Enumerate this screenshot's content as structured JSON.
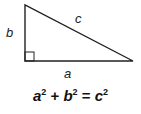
{
  "diagram": {
    "type": "right-triangle",
    "labels": {
      "a": "a",
      "b": "b",
      "c": "c"
    },
    "stroke_color": "#222222",
    "vertices": [
      [
        25,
        5
      ],
      [
        25,
        61
      ],
      [
        133,
        61
      ]
    ],
    "right_angle_marker": true
  },
  "formula": {
    "t1": "a",
    "e1": "2",
    "plus": "+",
    "t2": "b",
    "e2": "2",
    "eq": "=",
    "t3": "c",
    "e3": "2",
    "text": "a² + b² = c²"
  }
}
